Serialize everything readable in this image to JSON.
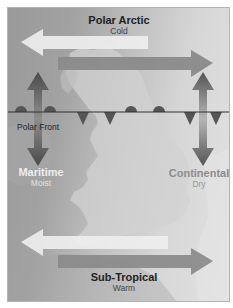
{
  "diagram": {
    "type": "air-masses-map",
    "region": "British Isles",
    "labels": {
      "polar_arctic": {
        "title": "Polar Arctic",
        "sub": "Cold"
      },
      "maritime": {
        "title": "Maritime",
        "sub": "Moist"
      },
      "continental": {
        "title": "Continental",
        "sub": "Dry"
      },
      "subtropical": {
        "title": "Sub-Tropical",
        "sub": "Warm"
      },
      "polar_front": "Polar Front"
    },
    "arrows": [
      {
        "name": "polar-arctic-westward",
        "direction": "left",
        "color": "#eeeeee"
      },
      {
        "name": "polar-arctic-eastward",
        "direction": "right",
        "color": "#8a8a8a"
      },
      {
        "name": "maritime-vertical",
        "direction": "up-down",
        "color": "#666666"
      },
      {
        "name": "continental-vertical",
        "direction": "up-down",
        "color": "#777777"
      },
      {
        "name": "subtropical-westward",
        "direction": "left",
        "color": "#eeeeee"
      },
      {
        "name": "subtropical-eastward",
        "direction": "right",
        "color": "#8a8a8a"
      }
    ],
    "front": {
      "type": "occluded-style polar front",
      "warm_bumps": 4,
      "cold_triangles": 4,
      "line_color": "#333333"
    }
  }
}
